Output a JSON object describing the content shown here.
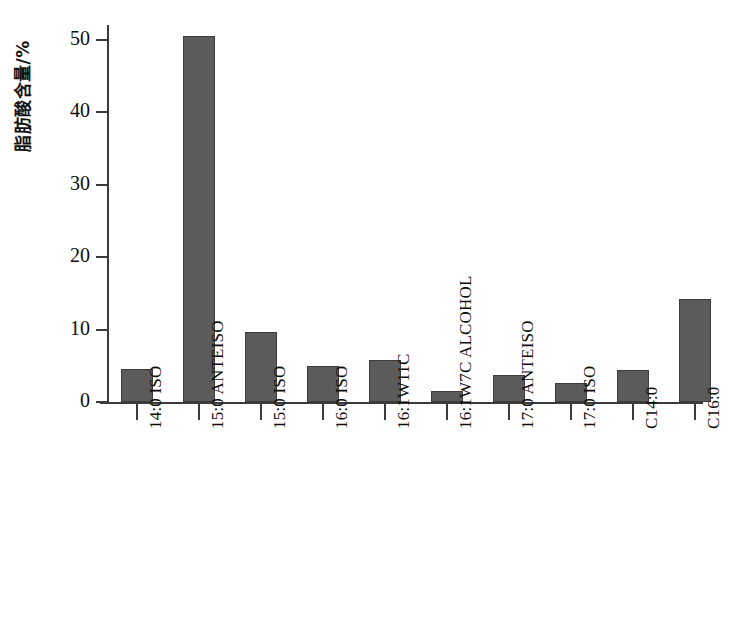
{
  "chart_data": {
    "type": "bar",
    "title": "",
    "subtitle": "",
    "xlabel": "",
    "ylabel": "脂肪酸含量/%",
    "ylim": [
      0,
      52
    ],
    "yticks": [
      0,
      10,
      20,
      30,
      40,
      50
    ],
    "ytick_labels": [
      "0",
      "10",
      "20",
      "30",
      "40",
      "50"
    ],
    "grid": false,
    "legend": null,
    "bar_color": "#5b5b5b",
    "bar_edge_color": "#3d3d3d",
    "axis_color": "#3b3b3b",
    "categories": [
      "14:0 ISO",
      "15:0 ANTEISO",
      "15:0 ISO",
      "16:0 ISO",
      "16:1W11C",
      "16:1W7C ALCOHOL",
      "17:0 ANTEISO",
      "17:0 ISO",
      "C14:0",
      "C16:0"
    ],
    "values": [
      4.6,
      50.5,
      9.6,
      5.0,
      5.8,
      1.5,
      3.7,
      2.6,
      4.4,
      14.2
    ],
    "xtick_label_rotation": 90
  },
  "axis": {
    "y_title": "脂肪酸含量/%"
  }
}
